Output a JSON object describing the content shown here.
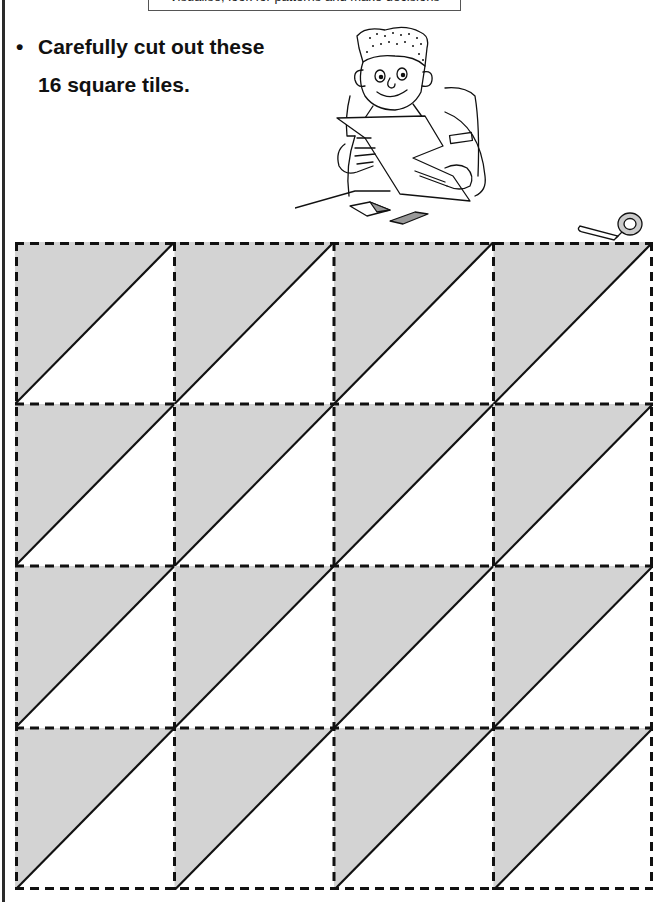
{
  "header": {
    "subtitle": "Visualise, look for patterns and make decisions"
  },
  "instruction": {
    "bullet": "•",
    "line1": "Carefully cut out these",
    "line2": "16 square tiles."
  },
  "illustration": {
    "description": "Cartoon boy at a desk cutting paper with scissors, with two triangle tiles on the desk"
  },
  "tiles": {
    "rows": 4,
    "cols": 4,
    "count": 16,
    "pattern": "diagonal from bottom-left to top-right; upper-left triangle shaded",
    "shade_color": "#d3d3d3",
    "line_color": "#111111",
    "cut_line_style": "dashed"
  }
}
